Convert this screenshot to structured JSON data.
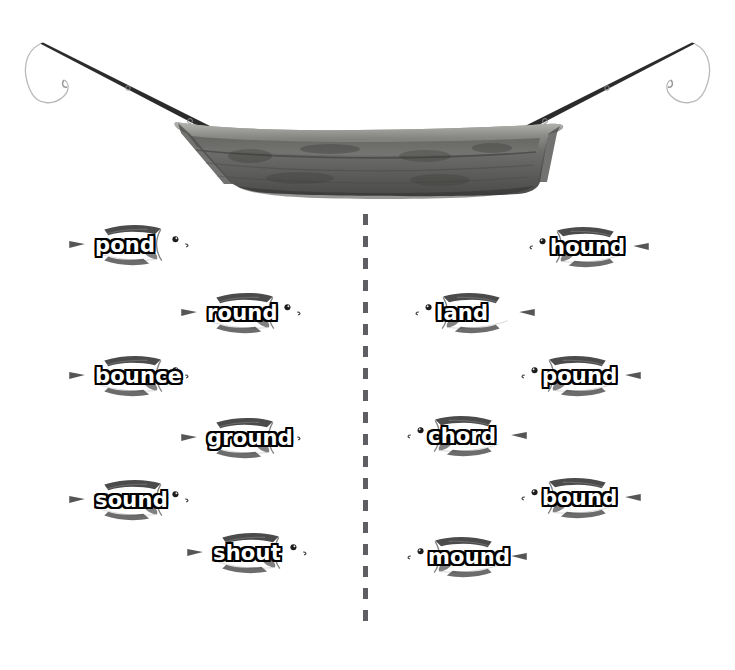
{
  "scene": {
    "boat": {
      "name": "wooden-rowboat",
      "body_color": "#6e6e6e",
      "rim_color": "#8d8d8a",
      "shadow_color": "#3b3b3b"
    },
    "rods": [
      {
        "name": "fishing-rod-left",
        "side": "left",
        "color": "#2a2a2a",
        "line_color": "#b9b9b9"
      },
      {
        "name": "fishing-rod-right",
        "side": "right",
        "color": "#2a2a2a",
        "line_color": "#b9b9b9"
      }
    ]
  },
  "divider": {
    "orientation": "vertical",
    "style": "dashed",
    "color": "#5e5e63"
  },
  "fish_appearance": {
    "body_top_color": "#4a4a4a",
    "body_mid_color": "#8a8a8a",
    "body_bottom_color": "#c9c9c9",
    "fin_color": "#5a5a5a",
    "eye_color": "#1a1a1a",
    "label_text_color": "#ffffff",
    "label_outline_color": "#000000"
  },
  "left_group": {
    "name": "left-fish-group",
    "fish": [
      {
        "label": "pond",
        "x": 40,
        "y": 219,
        "facing": "right"
      },
      {
        "label": "round",
        "x": 152,
        "y": 287,
        "facing": "right"
      },
      {
        "label": "bounce",
        "x": 40,
        "y": 350,
        "facing": "right"
      },
      {
        "label": "ground",
        "x": 152,
        "y": 412,
        "facing": "right"
      },
      {
        "label": "sound",
        "x": 40,
        "y": 474,
        "facing": "right"
      },
      {
        "label": "shout",
        "x": 158,
        "y": 527,
        "facing": "right"
      }
    ]
  },
  "right_group": {
    "name": "right-fish-group",
    "fish": [
      {
        "label": "hound",
        "x": 526,
        "y": 221,
        "facing": "left"
      },
      {
        "label": "land",
        "x": 412,
        "y": 287,
        "facing": "left"
      },
      {
        "label": "pound",
        "x": 518,
        "y": 350,
        "facing": "left"
      },
      {
        "label": "chord",
        "x": 404,
        "y": 410,
        "facing": "left"
      },
      {
        "label": "bound",
        "x": 518,
        "y": 472,
        "facing": "left"
      },
      {
        "label": "mound",
        "x": 404,
        "y": 531,
        "facing": "left"
      }
    ]
  }
}
